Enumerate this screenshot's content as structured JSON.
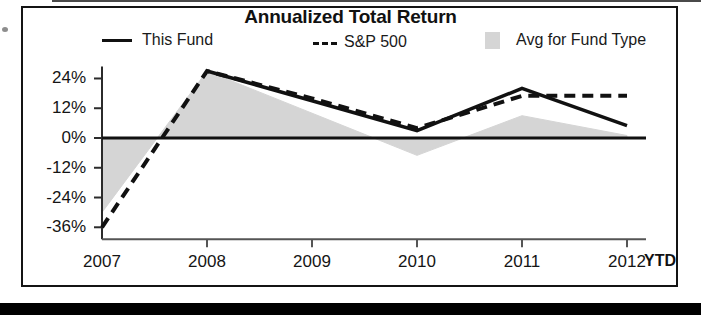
{
  "chart_data": {
    "type": "line",
    "title": "Annualized Total Return",
    "xlabel": "",
    "ylabel": "",
    "x_axis_note": "YTD",
    "categories": [
      "2007",
      "2008",
      "2009",
      "2010",
      "2011",
      "2012"
    ],
    "ytick_labels": [
      "24%",
      "12%",
      "0%",
      "-12%",
      "-24%",
      "-36%"
    ],
    "ytick_values": [
      24,
      12,
      0,
      -12,
      -24,
      -36
    ],
    "ylim": [
      -40,
      30
    ],
    "grid": false,
    "legend_position": "top",
    "series": [
      {
        "name": "This Fund",
        "style": "solid-line",
        "color": "#111111",
        "values": [
          null,
          27,
          15,
          3,
          20,
          5
        ]
      },
      {
        "name": "S&P 500",
        "style": "dashed-line",
        "color": "#111111",
        "values": [
          -36,
          27,
          16,
          4,
          17,
          17
        ]
      },
      {
        "name": "Avg for Fund Type",
        "style": "filled-area",
        "color": "#d5d5d5",
        "values": [
          -30,
          27,
          10,
          -7,
          9,
          1
        ]
      }
    ],
    "axis_px": {
      "x_origin": 102,
      "x_end": 640,
      "x_step": 105,
      "y_zero": 138,
      "y_per_pct": 2.48
    }
  },
  "legend": {
    "items": [
      {
        "label": "This Fund",
        "swatch": "solid-line-swatch"
      },
      {
        "label": "S&P 500",
        "swatch": "dashed-line-swatch"
      },
      {
        "label": "Avg for Fund Type",
        "swatch": "area-fill-swatch"
      }
    ]
  },
  "colors": {
    "line": "#111111",
    "area_fill": "#d5d5d5",
    "frame": "#141414",
    "bottom_bar": "#000000",
    "background": "#ffffff"
  }
}
